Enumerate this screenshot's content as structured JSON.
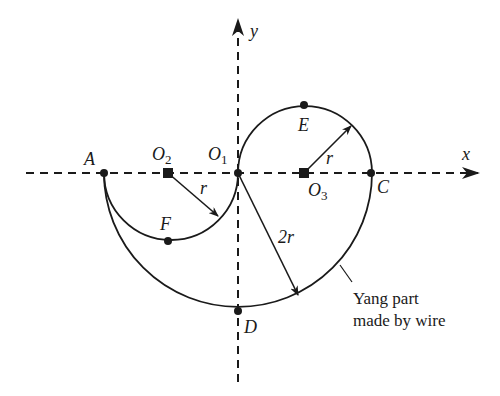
{
  "diagram": {
    "axes": {
      "x_label": "x",
      "y_label": "y"
    },
    "points": {
      "A": {
        "label": "A"
      },
      "O1": {
        "label": "O",
        "sub": "1"
      },
      "O2": {
        "label": "O",
        "sub": "2"
      },
      "O3": {
        "label": "O",
        "sub": "3"
      },
      "C": {
        "label": "C"
      },
      "D": {
        "label": "D"
      },
      "E": {
        "label": "E"
      },
      "F": {
        "label": "F"
      }
    },
    "radii": {
      "small_O2": "r",
      "small_O3": "r",
      "large_O1": "2r"
    },
    "annotation": {
      "line1": "Yang part",
      "line2": "made by wire"
    }
  }
}
